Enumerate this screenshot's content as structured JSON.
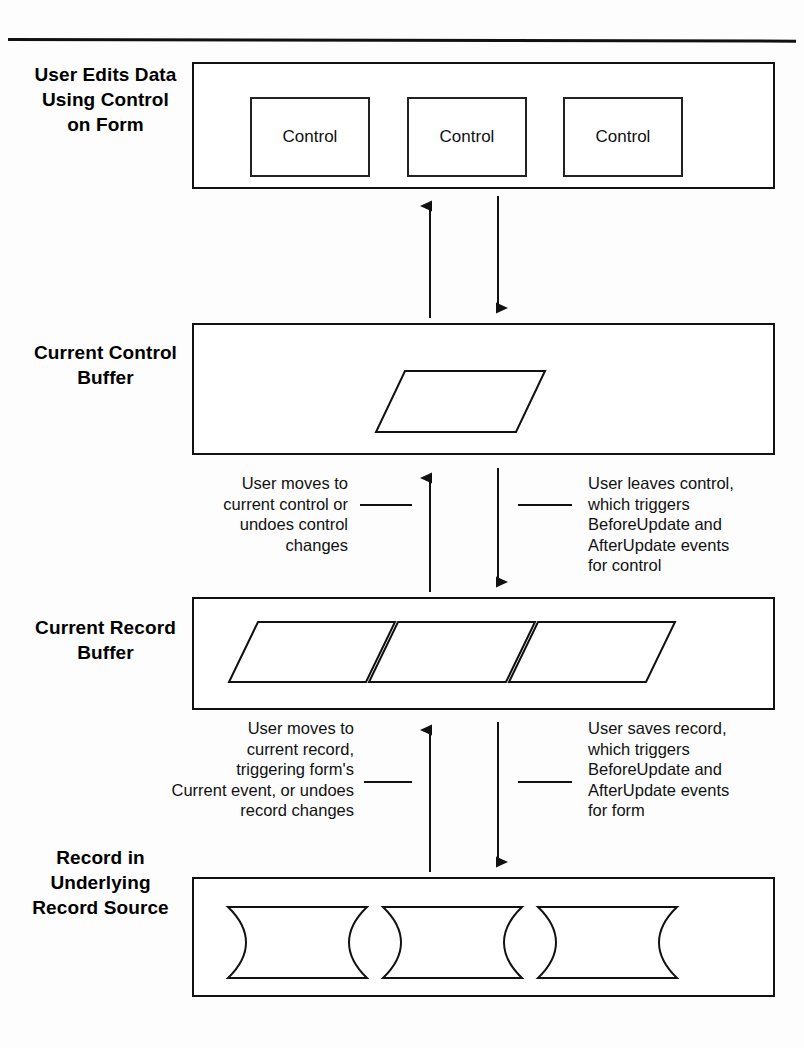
{
  "diagram": {
    "stages": [
      {
        "id": "form",
        "label": "User Edits\nData Using\nControl on\nForm",
        "items": [
          "Control",
          "Control",
          "Control"
        ],
        "item_shape": "rectangle"
      },
      {
        "id": "control-buffer",
        "label": "Current\nControl\nBuffer",
        "items": [
          "",
          ""
        ],
        "item_shape": "parallelogram"
      },
      {
        "id": "record-buffer",
        "label": "Current\nRecord\nBuffer",
        "items": [
          "",
          "",
          ""
        ],
        "item_shape": "parallelogram"
      },
      {
        "id": "record-source",
        "label": "Record in\nUnderlying\nRecord\nSource",
        "items": [
          "Field",
          "Field",
          "Field"
        ],
        "item_shape": "field"
      }
    ],
    "connectors": [
      {
        "id": "form-to-control-buffer",
        "up_arrow_note": "",
        "down_arrow_note": ""
      },
      {
        "id": "control-buffer-to-record-buffer",
        "up_arrow_note": "User moves to\ncurrent control or\nundoes control\nchanges",
        "down_arrow_note": "User leaves control,\nwhich triggers\nBeforeUpdate and\nAfterUpdate events\nfor control"
      },
      {
        "id": "record-buffer-to-record-source",
        "up_arrow_note": "User moves to\ncurrent record,\ntriggering form's\nCurrent event, or undoes\nrecord changes",
        "down_arrow_note": "User saves record,\nwhich triggers\nBeforeUpdate and\nAfterUpdate events\nfor form"
      }
    ],
    "colors": {
      "ink": "#111111",
      "paper": "#ffffff"
    }
  }
}
